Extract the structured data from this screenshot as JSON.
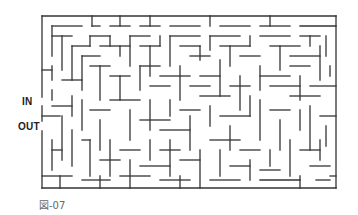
{
  "labels": {
    "entrance": "IN",
    "exit": "OUT"
  },
  "caption": "図-07",
  "maze": {
    "stroke": "#333333",
    "outer": {
      "x": 42,
      "y": 16,
      "w": 294,
      "h": 172
    },
    "entrance_gap": {
      "y1": 97,
      "y2": 106
    },
    "exit_gap": {
      "y1": 121,
      "y2": 131
    },
    "walls": [
      [
        52,
        26,
        82,
        26
      ],
      [
        92,
        16,
        92,
        26
      ],
      [
        92,
        26,
        100,
        26
      ],
      [
        110,
        26,
        130,
        26
      ],
      [
        120,
        16,
        120,
        26
      ],
      [
        140,
        26,
        160,
        26
      ],
      [
        150,
        16,
        150,
        26
      ],
      [
        170,
        26,
        200,
        26
      ],
      [
        210,
        16,
        210,
        26
      ],
      [
        220,
        26,
        250,
        26
      ],
      [
        260,
        26,
        290,
        26
      ],
      [
        270,
        16,
        270,
        26
      ],
      [
        300,
        26,
        336,
        26
      ],
      [
        52,
        26,
        52,
        56
      ],
      [
        52,
        36,
        72,
        36
      ],
      [
        62,
        36,
        62,
        70
      ],
      [
        72,
        46,
        72,
        80
      ],
      [
        72,
        46,
        90,
        46
      ],
      [
        90,
        36,
        90,
        46
      ],
      [
        90,
        36,
        110,
        36
      ],
      [
        110,
        36,
        110,
        46
      ],
      [
        82,
        56,
        82,
        90
      ],
      [
        82,
        56,
        100,
        56
      ],
      [
        100,
        46,
        130,
        46
      ],
      [
        120,
        46,
        120,
        56
      ],
      [
        130,
        36,
        130,
        66
      ],
      [
        130,
        36,
        150,
        36
      ],
      [
        140,
        46,
        160,
        46
      ],
      [
        150,
        46,
        150,
        76
      ],
      [
        160,
        36,
        160,
        46
      ],
      [
        170,
        36,
        170,
        66
      ],
      [
        170,
        36,
        200,
        36
      ],
      [
        180,
        46,
        200,
        46
      ],
      [
        200,
        46,
        200,
        60
      ],
      [
        190,
        56,
        210,
        56
      ],
      [
        210,
        36,
        210,
        50
      ],
      [
        210,
        36,
        240,
        36
      ],
      [
        220,
        46,
        250,
        46
      ],
      [
        230,
        46,
        230,
        66
      ],
      [
        240,
        56,
        260,
        56
      ],
      [
        250,
        36,
        250,
        46
      ],
      [
        260,
        36,
        290,
        36
      ],
      [
        270,
        46,
        300,
        46
      ],
      [
        280,
        46,
        280,
        70
      ],
      [
        290,
        56,
        320,
        56
      ],
      [
        300,
        36,
        320,
        36
      ],
      [
        310,
        36,
        310,
        46
      ],
      [
        320,
        46,
        320,
        80
      ],
      [
        326,
        36,
        326,
        56
      ],
      [
        42,
        70,
        52,
        70
      ],
      [
        52,
        66,
        52,
        80
      ],
      [
        62,
        80,
        82,
        80
      ],
      [
        90,
        66,
        110,
        66
      ],
      [
        100,
        66,
        100,
        100
      ],
      [
        110,
        76,
        130,
        76
      ],
      [
        120,
        76,
        120,
        100
      ],
      [
        140,
        66,
        160,
        66
      ],
      [
        140,
        66,
        140,
        90
      ],
      [
        150,
        86,
        170,
        86
      ],
      [
        160,
        76,
        190,
        76
      ],
      [
        180,
        66,
        180,
        100
      ],
      [
        190,
        86,
        210,
        86
      ],
      [
        200,
        76,
        220,
        76
      ],
      [
        220,
        60,
        220,
        96
      ],
      [
        230,
        86,
        250,
        86
      ],
      [
        240,
        76,
        240,
        110
      ],
      [
        260,
        66,
        260,
        90
      ],
      [
        260,
        76,
        290,
        76
      ],
      [
        270,
        86,
        300,
        86
      ],
      [
        290,
        66,
        310,
        66
      ],
      [
        300,
        76,
        300,
        100
      ],
      [
        310,
        86,
        336,
        86
      ],
      [
        330,
        66,
        330,
        76
      ],
      [
        52,
        90,
        52,
        100
      ],
      [
        42,
        116,
        60,
        116
      ],
      [
        52,
        106,
        72,
        106
      ],
      [
        72,
        96,
        72,
        116
      ],
      [
        62,
        116,
        62,
        160
      ],
      [
        82,
        100,
        82,
        130
      ],
      [
        90,
        110,
        110,
        110
      ],
      [
        100,
        120,
        100,
        150
      ],
      [
        110,
        100,
        140,
        100
      ],
      [
        130,
        110,
        130,
        140
      ],
      [
        140,
        120,
        170,
        120
      ],
      [
        150,
        100,
        150,
        130
      ],
      [
        160,
        130,
        190,
        130
      ],
      [
        170,
        100,
        170,
        116
      ],
      [
        180,
        110,
        200,
        110
      ],
      [
        190,
        116,
        190,
        150
      ],
      [
        200,
        96,
        230,
        96
      ],
      [
        210,
        106,
        210,
        126
      ],
      [
        220,
        116,
        250,
        116
      ],
      [
        230,
        126,
        230,
        150
      ],
      [
        250,
        96,
        250,
        116
      ],
      [
        260,
        100,
        260,
        140
      ],
      [
        270,
        110,
        290,
        110
      ],
      [
        280,
        120,
        280,
        150
      ],
      [
        290,
        96,
        320,
        96
      ],
      [
        300,
        110,
        300,
        130
      ],
      [
        310,
        106,
        310,
        150
      ],
      [
        320,
        116,
        336,
        116
      ],
      [
        326,
        126,
        326,
        146
      ],
      [
        52,
        140,
        52,
        170
      ],
      [
        52,
        150,
        62,
        150
      ],
      [
        72,
        130,
        72,
        166
      ],
      [
        82,
        140,
        90,
        140
      ],
      [
        90,
        140,
        90,
        176
      ],
      [
        100,
        160,
        120,
        160
      ],
      [
        110,
        140,
        110,
        176
      ],
      [
        120,
        150,
        140,
        150
      ],
      [
        130,
        160,
        130,
        188
      ],
      [
        140,
        166,
        170,
        166
      ],
      [
        150,
        140,
        150,
        160
      ],
      [
        160,
        150,
        180,
        150
      ],
      [
        170,
        140,
        170,
        176
      ],
      [
        180,
        160,
        200,
        160
      ],
      [
        200,
        150,
        200,
        188
      ],
      [
        210,
        140,
        240,
        140
      ],
      [
        220,
        150,
        220,
        176
      ],
      [
        230,
        166,
        250,
        166
      ],
      [
        240,
        150,
        260,
        150
      ],
      [
        250,
        160,
        250,
        180
      ],
      [
        260,
        170,
        280,
        170
      ],
      [
        270,
        150,
        270,
        166
      ],
      [
        290,
        140,
        290,
        176
      ],
      [
        300,
        150,
        320,
        150
      ],
      [
        310,
        166,
        330,
        166
      ],
      [
        320,
        140,
        320,
        160
      ],
      [
        330,
        176,
        336,
        176
      ],
      [
        42,
        176,
        72,
        176
      ],
      [
        60,
        176,
        60,
        188
      ],
      [
        82,
        180,
        110,
        180
      ],
      [
        100,
        176,
        100,
        188
      ],
      [
        120,
        176,
        150,
        176
      ],
      [
        160,
        180,
        190,
        180
      ],
      [
        180,
        176,
        180,
        188
      ],
      [
        210,
        180,
        240,
        180
      ],
      [
        260,
        180,
        300,
        180
      ],
      [
        300,
        176,
        300,
        188
      ],
      [
        316,
        180,
        330,
        180
      ]
    ]
  }
}
